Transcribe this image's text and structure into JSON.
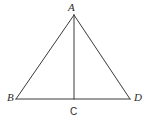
{
  "figure": {
    "type": "geometry-diagram",
    "background_color": "#ffffff",
    "stroke_color": "#3a3a3a",
    "stroke_width": 1,
    "canvas": {
      "width": 151,
      "height": 121
    },
    "points": {
      "A": {
        "label": "A",
        "x": 74,
        "y": 15,
        "style": "italic-serif"
      },
      "B": {
        "label": "B",
        "x": 16,
        "y": 99,
        "style": "italic-serif"
      },
      "C": {
        "label": "C",
        "x": 74,
        "y": 99,
        "style": "upright-sans"
      },
      "D": {
        "label": "D",
        "x": 130,
        "y": 99,
        "style": "italic-serif"
      }
    },
    "segments": [
      {
        "name": "AB",
        "from": "A",
        "to": "B"
      },
      {
        "name": "AD",
        "from": "A",
        "to": "D"
      },
      {
        "name": "BD",
        "from": "B",
        "to": "D"
      },
      {
        "name": "AC",
        "from": "A",
        "to": "C"
      }
    ]
  }
}
